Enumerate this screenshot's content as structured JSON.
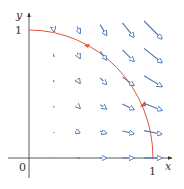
{
  "figure": {
    "axes": {
      "x_label": "x",
      "y_label": "y",
      "origin_label": "0",
      "x_tick_label": "1",
      "y_tick_label": "1"
    },
    "vector_field": {
      "description": "F(x,y) = x^2 i - xy j",
      "grid_x": [
        0.2,
        0.4,
        0.6,
        0.8,
        1.0
      ],
      "grid_y": [
        0.0,
        0.2,
        0.4,
        0.6,
        0.8,
        1.0
      ],
      "arrow_color": "#4a78b5"
    },
    "curve": {
      "description": "quarter unit circle from (1,0) to (0,1), counterclockwise",
      "color": "#e0553c"
    },
    "axis_color": "#333333"
  }
}
